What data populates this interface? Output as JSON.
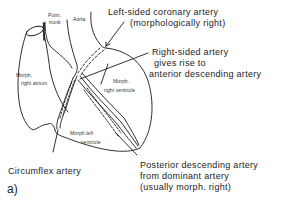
{
  "figure": {
    "panel_label": "a)",
    "structures": {
      "pulm_trunk_line1": "Pulm.",
      "pulm_trunk_line2": "trunk",
      "aorta": "Aorta",
      "right_atrium_line1": "Morph.",
      "right_atrium_line2": "right atrium",
      "right_ventricle_line1": "Morph.",
      "right_ventricle_line2": "right ventricle",
      "left_ventricle_line1": "Morph.left",
      "left_ventricle_line2": "ventricle"
    },
    "callouts": {
      "left_coronary": {
        "line1": "Left-sided coronary artery",
        "line2": "(morphologically right)"
      },
      "right_sided": {
        "line1": "Right-sided artery",
        "line2": "gives rise to",
        "line3": "anterior descending artery"
      },
      "circumflex": {
        "line1": "Circumflex artery"
      },
      "posterior_descending": {
        "line1": "Posterior descending artery",
        "line2": "from dominant artery",
        "line3": "(usually morph. right)"
      }
    },
    "colors": {
      "line": "#1a1a1a",
      "background": "#ffffff"
    }
  }
}
